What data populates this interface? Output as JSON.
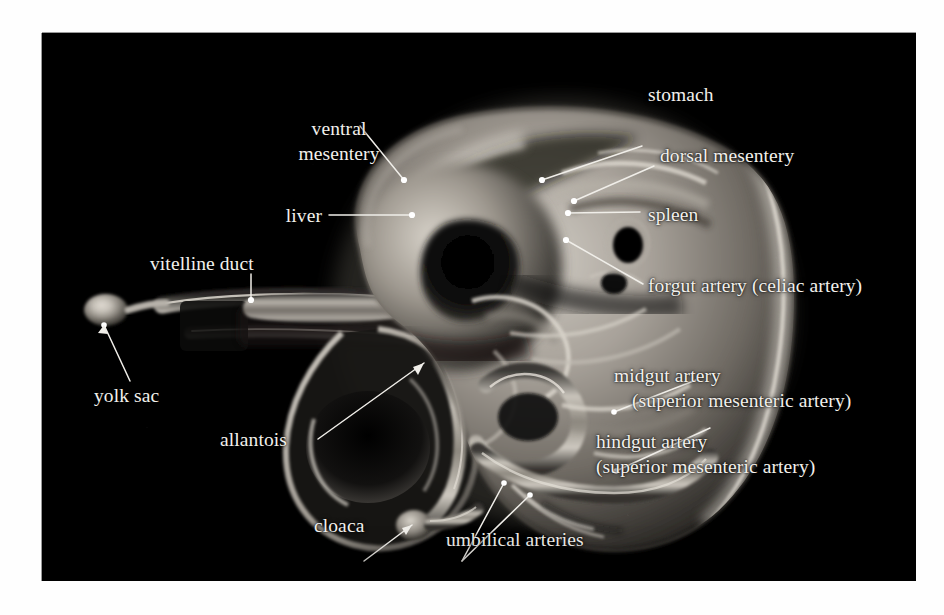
{
  "plate": {
    "background_color": "#000000",
    "border_color": "#9a9a9a",
    "page_background": "#fefefe",
    "label_color": "#f2f0ec",
    "caption_style": "white serif labels with thin white leader lines"
  },
  "figure": {
    "image_type": "grayscale photomicrograph"
  },
  "labels": [
    {
      "id": "ventral-mesentery",
      "text_lines": [
        "ventral",
        "mesentery"
      ]
    },
    {
      "id": "stomach",
      "text_lines": [
        "stomach"
      ]
    },
    {
      "id": "dorsal-mesentery",
      "text_lines": [
        "dorsal mesentery"
      ]
    },
    {
      "id": "liver",
      "text_lines": [
        "liver"
      ]
    },
    {
      "id": "spleen",
      "text_lines": [
        "spleen"
      ]
    },
    {
      "id": "forgut-artery",
      "text_lines": [
        "forgut artery (celiac artery)"
      ]
    },
    {
      "id": "vitelline-duct",
      "text_lines": [
        "vitelline duct"
      ]
    },
    {
      "id": "yolk-sac",
      "text_lines": [
        "yolk sac"
      ]
    },
    {
      "id": "allantois",
      "text_lines": [
        "allantois"
      ]
    },
    {
      "id": "cloaca",
      "text_lines": [
        "cloaca"
      ]
    },
    {
      "id": "umbilical-arteries",
      "text_lines": [
        "umbilical arteries"
      ]
    },
    {
      "id": "midgut-artery",
      "text_lines": [
        "midgut artery",
        "(superior mesenteric artery)"
      ]
    },
    {
      "id": "hindgut-artery",
      "text_lines": [
        "hindgut artery",
        "(superior mesenteric artery)"
      ]
    }
  ],
  "label_text": {
    "ventral_mesentery_1": "ventral",
    "ventral_mesentery_2": "mesentery",
    "stomach": "stomach",
    "dorsal_mesentery": "dorsal mesentery",
    "liver": "liver",
    "spleen": "spleen",
    "forgut_artery": "forgut artery (celiac artery)",
    "vitelline_duct": "vitelline duct",
    "yolk_sac": "yolk sac",
    "allantois": "allantois",
    "cloaca": "cloaca",
    "umbilical_arteries": "umbilical arteries",
    "midgut_artery_1": "midgut artery",
    "midgut_artery_2": "(superior mesenteric artery)",
    "hindgut_artery_1": "hindgut artery",
    "hindgut_artery_2": "(superior mesenteric artery)"
  }
}
